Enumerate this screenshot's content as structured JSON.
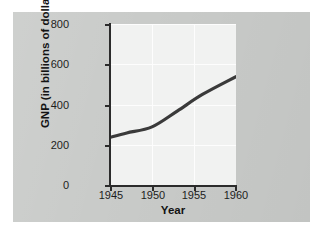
{
  "figure": {
    "card_color": "#c9cbc9",
    "plot_bg_color": "#f1f2f1",
    "gridline_color": "#fdfdfd",
    "axis_color": "#2b2b2b",
    "line_color": "#3a3a3a"
  },
  "chart_data": {
    "type": "line",
    "title": "",
    "subtitle": "",
    "xlabel": "Year",
    "ylabel": "GNP (in billions of dollars)",
    "xlim": [
      1945,
      1960
    ],
    "ylim": [
      0,
      800
    ],
    "x_ticks": [
      1945,
      1950,
      1955,
      1960
    ],
    "x_tick_labels": [
      "1945",
      "1950",
      "1955",
      "1960"
    ],
    "y_ticks": [
      0,
      200,
      400,
      600,
      800
    ],
    "y_tick_labels": [
      "0",
      "200",
      "400",
      "600",
      "800"
    ],
    "grid": true,
    "legend": false,
    "legend_position": "none",
    "series": [
      {
        "name": "GNP",
        "x": [
          1945,
          1947,
          1950,
          1953,
          1956,
          1960
        ],
        "values": [
          240,
          262,
          292,
          370,
          452,
          540
        ]
      }
    ],
    "annotations": []
  },
  "axes": {
    "y_labels": [
      "800",
      "600",
      "400",
      "200",
      "0"
    ],
    "x_labels": [
      "1945",
      "1950",
      "1955",
      "1960"
    ],
    "y_title": "GNP (in billions of dollars)",
    "x_title": "Year"
  }
}
